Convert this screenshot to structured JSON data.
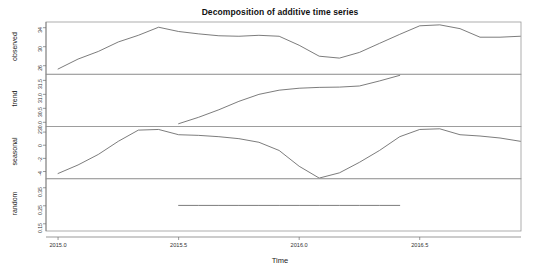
{
  "chart_data": {
    "type": "line",
    "title": "Decomposition of additive time series",
    "xlabel": "Time",
    "ylabel": "",
    "grid": false,
    "legend": "none",
    "xlim": [
      2014.95,
      2016.92
    ],
    "xticks": [
      "2015.0",
      "2015.5",
      "2016.0",
      "2016.5"
    ],
    "xtick_values": [
      2015.0,
      2015.5,
      2016.0,
      2016.5
    ],
    "panels": [
      {
        "name": "observed",
        "ylabel": "observed",
        "yticks": [
          "26",
          "30",
          "34"
        ],
        "ytick_values": [
          26,
          30,
          34
        ],
        "ylim": [
          24.2,
          35.2
        ],
        "x": [
          2015.0,
          2015.083,
          2015.167,
          2015.25,
          2015.333,
          2015.417,
          2015.5,
          2015.583,
          2015.667,
          2015.75,
          2015.833,
          2015.917,
          2016.0,
          2016.083,
          2016.167,
          2016.25,
          2016.333,
          2016.417,
          2016.5,
          2016.583,
          2016.667,
          2016.75,
          2016.833,
          2016.917
        ],
        "y": [
          25.3,
          27.4,
          29.0,
          31.0,
          32.4,
          34.1,
          33.2,
          32.7,
          32.3,
          32.2,
          32.4,
          32.2,
          30.3,
          28.0,
          27.6,
          28.8,
          30.7,
          32.6,
          34.4,
          34.6,
          33.8,
          32.0,
          32.0,
          32.2
        ]
      },
      {
        "name": "trend",
        "ylabel": "trend",
        "yticks": [
          "30.0",
          "30.5",
          "31.0",
          "31.5"
        ],
        "ytick_values": [
          30.0,
          30.5,
          31.0,
          31.5
        ],
        "ylim": [
          29.85,
          31.72
        ],
        "x": [
          2015.5,
          2015.583,
          2015.667,
          2015.75,
          2015.833,
          2015.917,
          2016.0,
          2016.083,
          2016.167,
          2016.25,
          2016.333,
          2016.417
        ],
        "y": [
          29.95,
          30.18,
          30.45,
          30.75,
          31.0,
          31.15,
          31.22,
          31.25,
          31.26,
          31.3,
          31.48,
          31.68
        ]
      },
      {
        "name": "seasonal",
        "ylabel": "seasonal",
        "yticks": [
          "-4",
          "-2",
          "0",
          "2"
        ],
        "ytick_values": [
          -4,
          -2,
          0,
          2
        ],
        "ylim": [
          -5.1,
          2.85
        ],
        "x": [
          2015.0,
          2015.083,
          2015.167,
          2015.25,
          2015.333,
          2015.417,
          2015.5,
          2015.583,
          2015.667,
          2015.75,
          2015.833,
          2015.917,
          2016.0,
          2016.083,
          2016.167,
          2016.25,
          2016.333,
          2016.417,
          2016.5,
          2016.583,
          2016.667,
          2016.75,
          2016.833,
          2016.917
        ],
        "y": [
          -4.3,
          -3.0,
          -1.4,
          0.6,
          2.3,
          2.4,
          1.6,
          1.5,
          1.3,
          1.0,
          0.45,
          -0.8,
          -3.2,
          -5.0,
          -4.2,
          -2.6,
          -0.8,
          1.3,
          2.4,
          2.5,
          1.6,
          1.4,
          1.1,
          0.6
        ]
      },
      {
        "name": "random",
        "ylabel": "random",
        "yticks": [
          "0.15",
          "0.25",
          "0.35"
        ],
        "ytick_values": [
          0.15,
          0.25,
          0.35
        ],
        "ylim": [
          0.11,
          0.4
        ],
        "x": [
          2015.5,
          2015.583,
          2015.667,
          2015.75,
          2015.833,
          2015.917,
          2016.0,
          2016.083,
          2016.167,
          2016.25,
          2016.333,
          2016.417
        ],
        "y": [
          0.252,
          0.252,
          0.252,
          0.252,
          0.252,
          0.252,
          0.252,
          0.252,
          0.252,
          0.252,
          0.252,
          0.252
        ]
      }
    ]
  },
  "colors": {
    "line": "#5a5a5a",
    "frame": "#9a9a9a",
    "text": "#222222",
    "background": "#ffffff"
  }
}
